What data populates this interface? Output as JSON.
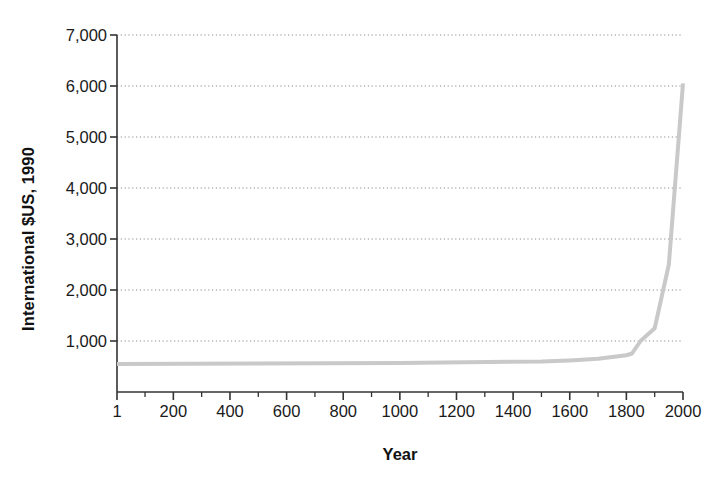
{
  "chart_data": {
    "type": "line",
    "title": "",
    "xlabel": "Year",
    "ylabel": "International $US, 1990",
    "xlim": [
      1,
      2000
    ],
    "ylim": [
      0,
      7000
    ],
    "grid": true,
    "grid_style": "dotted-horizontal",
    "legend": "none",
    "series": [
      {
        "name": "GDP per capita",
        "color": "#c9c9c9",
        "line_width": 4,
        "x": [
          1,
          1000,
          1500,
          1600,
          1700,
          1800,
          1820,
          1850,
          1900,
          1950,
          2000
        ],
        "values": [
          550,
          570,
          600,
          620,
          650,
          720,
          755,
          1000,
          1250,
          2500,
          6050
        ]
      }
    ],
    "y_ticks": [
      {
        "value": 1000,
        "label": "1,000"
      },
      {
        "value": 2000,
        "label": "2,000"
      },
      {
        "value": 3000,
        "label": "3,000"
      },
      {
        "value": 4000,
        "label": "4,000"
      },
      {
        "value": 5000,
        "label": "5,000"
      },
      {
        "value": 6000,
        "label": "6,000"
      },
      {
        "value": 7000,
        "label": "7,000"
      }
    ],
    "x_ticks": [
      {
        "value": 1,
        "label": "1"
      },
      {
        "value": 200,
        "label": "200"
      },
      {
        "value": 400,
        "label": "400"
      },
      {
        "value": 600,
        "label": "600"
      },
      {
        "value": 800,
        "label": "800"
      },
      {
        "value": 1000,
        "label": "1000"
      },
      {
        "value": 1200,
        "label": "1200"
      },
      {
        "value": 1400,
        "label": "1400"
      },
      {
        "value": 1600,
        "label": "1600"
      },
      {
        "value": 1800,
        "label": "1800"
      },
      {
        "value": 2000,
        "label": "2000"
      }
    ],
    "x_minor_ticks": [
      100,
      300,
      500,
      700,
      900,
      1100,
      1300,
      1500,
      1700,
      1900
    ],
    "colors": {
      "axis": "#333333",
      "grid": "#8c8c8c",
      "line": "#c9c9c9",
      "text": "#1a1a1a",
      "background": "#ffffff"
    }
  }
}
